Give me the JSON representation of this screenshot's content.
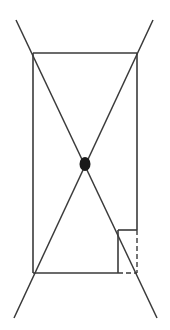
{
  "diagram": {
    "colors": {
      "stroke": "#3a3a3a",
      "dot": "#1a1a1a",
      "background": "#ffffff"
    },
    "rectangle": {
      "top_left": [
        33,
        53
      ],
      "top_right": [
        137,
        53
      ],
      "bottom_left": [
        33,
        273
      ],
      "bottom_right": [
        137,
        273
      ]
    },
    "diagonals": [
      {
        "name": "diagonal-tl-br",
        "from": [
          16,
          20
        ],
        "to": [
          157,
          318
        ]
      },
      {
        "name": "diagonal-tr-bl",
        "from": [
          153,
          20
        ],
        "to": [
          14,
          318
        ]
      }
    ],
    "center_dot": {
      "cx": 85,
      "cy": 164,
      "rx": 5,
      "ry": 7
    },
    "notch": {
      "top_y": 230,
      "inner_x": 118,
      "dashed_vertical": {
        "x": 137,
        "y1": 230,
        "y2": 273
      },
      "dashed_horizontal": {
        "y": 273,
        "x1": 118,
        "x2": 137
      }
    }
  }
}
